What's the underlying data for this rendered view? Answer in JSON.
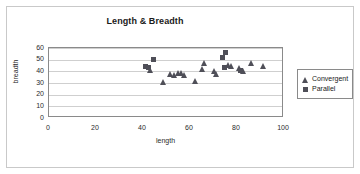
{
  "chart_data": {
    "type": "scatter",
    "title": "Length & Breadth",
    "xlabel": "length",
    "ylabel": "breadth",
    "xlim": [
      0,
      100
    ],
    "ylim": [
      0,
      60
    ],
    "xticks": [
      0,
      20,
      40,
      60,
      80,
      100
    ],
    "yticks": [
      0,
      10,
      20,
      30,
      40,
      50,
      60
    ],
    "grid": "horizontal",
    "legend_position": "right",
    "marker_color": "#4f4f58",
    "series": [
      {
        "name": "Convergent",
        "marker": "triangle",
        "points": [
          [
            43,
            41
          ],
          [
            51.5,
            38
          ],
          [
            53,
            37
          ],
          [
            55,
            39
          ],
          [
            56,
            38.5
          ],
          [
            57.5,
            36.5
          ],
          [
            48.5,
            31
          ],
          [
            62,
            32
          ],
          [
            65,
            42
          ],
          [
            66,
            47
          ],
          [
            70,
            40
          ],
          [
            71,
            37.5
          ],
          [
            76,
            45.5
          ],
          [
            77.5,
            45
          ],
          [
            81,
            42.5
          ],
          [
            82.5,
            40
          ],
          [
            86,
            47
          ],
          [
            91,
            45
          ]
        ]
      },
      {
        "name": "Parallel",
        "marker": "square",
        "points": [
          [
            41,
            44.5
          ],
          [
            42.5,
            43
          ],
          [
            44.5,
            50
          ],
          [
            74,
            52
          ],
          [
            75,
            56
          ],
          [
            74.5,
            43
          ],
          [
            81.5,
            40.5
          ]
        ]
      }
    ]
  },
  "legend": {
    "items": [
      {
        "label": "Convergent",
        "marker": "triangle"
      },
      {
        "label": "Parallel",
        "marker": "square"
      }
    ]
  }
}
